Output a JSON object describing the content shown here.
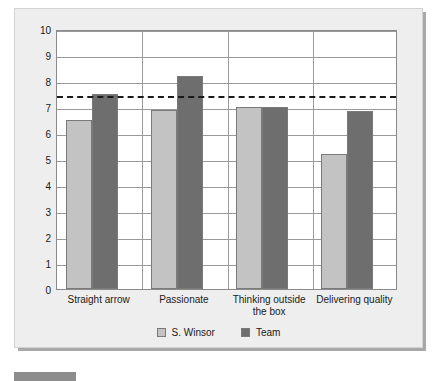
{
  "chart_data": {
    "type": "bar",
    "title": "",
    "xlabel": "",
    "ylabel": "",
    "categories": [
      "Straight arrow",
      "Passionate",
      "Thinking outside the box",
      "Delivering quality"
    ],
    "series": [
      {
        "name": "S. Winsor",
        "color": "#c3c3c3",
        "values": [
          6.5,
          6.9,
          7.0,
          5.2
        ]
      },
      {
        "name": "Team",
        "color": "#6e6e6e",
        "values": [
          7.5,
          8.2,
          7.0,
          6.85
        ]
      }
    ],
    "ylim": [
      0,
      10
    ],
    "yticks": [
      0,
      1,
      2,
      3,
      4,
      5,
      6,
      7,
      8,
      9,
      10
    ],
    "ytick_labels": [
      "0",
      "1",
      "2",
      "3",
      "4",
      "5",
      "6",
      "7",
      "8",
      "9",
      "10"
    ],
    "grid": true,
    "legend_position": "bottom",
    "reference_line": {
      "value": 7.5,
      "style": "dashed",
      "color": "#1a1a1a"
    }
  },
  "legend": {
    "items": [
      {
        "label": "S. Winsor"
      },
      {
        "label": "Team"
      }
    ]
  },
  "caption": {
    "text": ""
  }
}
